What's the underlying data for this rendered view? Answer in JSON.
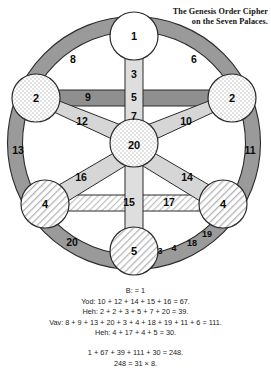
{
  "title": {
    "line1": "The Genesis Order Cipher",
    "line2": "on the Seven Palaces."
  },
  "diagram": {
    "name": "seven-palaces-wheel",
    "nodes": [
      {
        "id": "top",
        "label": "1",
        "fill": "plain",
        "cx": 134,
        "cy": 36,
        "r": 24
      },
      {
        "id": "upper-left",
        "label": "2",
        "fill": "checker",
        "cx": 36,
        "cy": 98,
        "r": 24
      },
      {
        "id": "upper-right",
        "label": "2",
        "fill": "checker",
        "cx": 232,
        "cy": 98,
        "r": 24
      },
      {
        "id": "center",
        "label": "20",
        "fill": "checker",
        "cx": 134,
        "cy": 143,
        "r": 24
      },
      {
        "id": "lower-left",
        "label": "4",
        "fill": "hatch",
        "cx": 45,
        "cy": 204,
        "r": 24
      },
      {
        "id": "lower-right",
        "label": "4",
        "fill": "hatch",
        "cx": 223,
        "cy": 204,
        "r": 24
      },
      {
        "id": "bottom",
        "label": "5",
        "fill": "hatch",
        "cx": 134,
        "cy": 251,
        "r": 24
      }
    ],
    "edge_labels": [
      {
        "id": "arc-top-left",
        "text": "8",
        "x": 73,
        "y": 60
      },
      {
        "id": "arc-top-right",
        "text": "6",
        "x": 194,
        "y": 60
      },
      {
        "id": "spoke-top-center-a",
        "text": "3",
        "x": 134,
        "y": 75
      },
      {
        "id": "bar-upper-left",
        "text": "9",
        "x": 88,
        "y": 92
      },
      {
        "id": "spoke-top-center-b",
        "text": "5",
        "x": 134,
        "y": 97
      },
      {
        "id": "spoke-top-center-c",
        "text": "7",
        "x": 134,
        "y": 116
      },
      {
        "id": "diag-upper-left",
        "text": "12",
        "x": 82,
        "y": 121
      },
      {
        "id": "diag-upper-right",
        "text": "10",
        "x": 185,
        "y": 121
      },
      {
        "id": "arc-mid-left",
        "text": "13",
        "x": 18,
        "y": 151
      },
      {
        "id": "arc-mid-right",
        "text": "11",
        "x": 249,
        "y": 151
      },
      {
        "id": "diag-lower-left",
        "text": "16",
        "x": 81,
        "y": 177
      },
      {
        "id": "diag-lower-right",
        "text": "14",
        "x": 187,
        "y": 177
      },
      {
        "id": "bar-mid-left",
        "text": "15",
        "x": 129,
        "y": 203
      },
      {
        "id": "bar-mid-right",
        "text": "17",
        "x": 168,
        "y": 203
      },
      {
        "id": "arc-bottom-left",
        "text": "20",
        "x": 72,
        "y": 243
      },
      {
        "id": "arc-bottom-right-1",
        "text": "3",
        "x": 159,
        "y": 251
      },
      {
        "id": "arc-bottom-right-2",
        "text": "4",
        "x": 173,
        "y": 248
      },
      {
        "id": "arc-bottom-right-3",
        "text": "18",
        "x": 191,
        "y": 243
      },
      {
        "id": "arc-bottom-right-4",
        "text": "19",
        "x": 206,
        "y": 235
      }
    ],
    "colors": {
      "ring_dark": "#9a9a9a",
      "spoke_light": "#d6d6d6",
      "bar_mid": "#8f8f8f",
      "stroke": "#2b2b2b",
      "node_plain": "#ffffff"
    }
  },
  "caption": {
    "lines": [
      "B: = 1",
      "Yod: 10 + 12 + 14 + 15 + 16 = 67.",
      "Heh: 2 + 2 + 3 + 5 + 7 + 20 = 39.",
      "Vav: 8 + 9 + 13 + 20 + 3 + 4 + 18 + 19 + 11 + 6 = 111.",
      "Heh: 4 + 17 + 4 + 5 = 30."
    ],
    "totals": [
      "1 + 67 + 39 + 111 + 30 = 248.",
      "248 = 31 × 8."
    ]
  }
}
